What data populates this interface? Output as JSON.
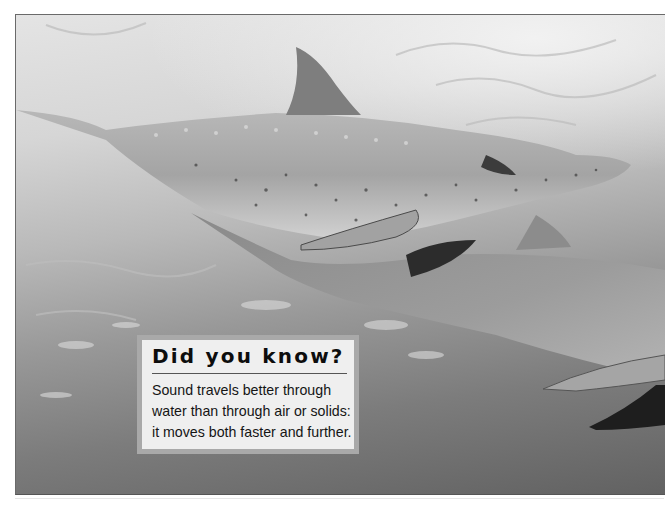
{
  "photo": {
    "subject": "two spotted dolphins swimming underwater",
    "tone": "grayscale",
    "colors": {
      "water_light": "#e4e4e4",
      "water_dark": "#626262",
      "dolphin_body": "#a8a8a8",
      "fin_dark": "#2a2a2a"
    }
  },
  "fact_box": {
    "title": "Did you know?",
    "body_lines": [
      "Sound travels better through",
      "water than through air or solids:",
      "it moves both faster and further."
    ],
    "colors": {
      "background": "#efefef",
      "border": "#a9a9a9",
      "text": "#151515"
    }
  }
}
